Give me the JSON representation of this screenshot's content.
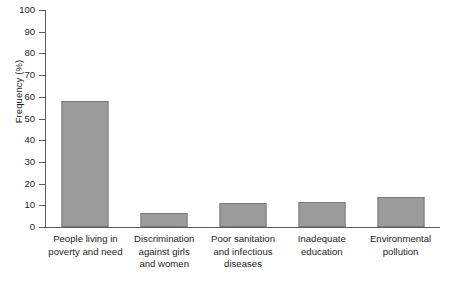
{
  "chart_data": {
    "type": "bar",
    "title": "",
    "xlabel": "",
    "ylabel": "Frequency (%)",
    "ylim": [
      0,
      100
    ],
    "ytick_step": 10,
    "grid": false,
    "legend": "none",
    "bar_color": "#9b9b9b",
    "bar_edge_color": "#7a7a7a",
    "axis_color": "#5d5d5d",
    "background": "#ffffff",
    "yticks": [
      "100",
      "90",
      "80",
      "70",
      "60",
      "50",
      "40",
      "30",
      "20",
      "10",
      "0"
    ],
    "categories": [
      "People living in poverty and need",
      "Discrimination against girls and women",
      "Poor sanitation and infectious diseases",
      "Inadequate education",
      "Environmental pollution"
    ],
    "category_lines": [
      [
        "People living in",
        "poverty and need"
      ],
      [
        "Discrimination",
        "against girls",
        "and women"
      ],
      [
        "Poor sanitation",
        "and infectious",
        "diseases"
      ],
      [
        "Inadequate",
        "education"
      ],
      [
        "Environmental",
        "pollution"
      ]
    ],
    "values": [
      58,
      6.5,
      11,
      11.5,
      14
    ]
  }
}
